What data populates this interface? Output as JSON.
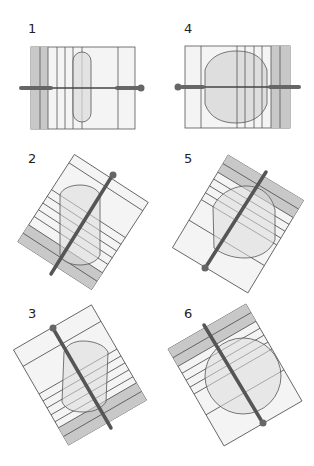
{
  "diagram": {
    "type": "rod-insertion-sequence",
    "colors": {
      "background": "#ffffff",
      "block_fill": "#f2f2f2",
      "stripe_fill": "#f7f7f7",
      "shaded_fill": "#c8c8c8",
      "shape_fill": "#e4e4e4",
      "outline": "#555555",
      "rod": "#555555"
    },
    "panels": [
      {
        "label": "1",
        "orientation": "horizontal",
        "rod_ball": "right",
        "shape": "capsule",
        "shaded_side": "left"
      },
      {
        "label": "2",
        "orientation": "tilted",
        "rod_ball": "top",
        "shape": "capsule",
        "shaded_side": "bottom"
      },
      {
        "label": "3",
        "orientation": "tilted",
        "rod_ball": "top",
        "shape": "capsule",
        "shaded_side": "bottom"
      },
      {
        "label": "4",
        "orientation": "horizontal",
        "rod_ball": "left",
        "shape": "oval",
        "shaded_side": "right"
      },
      {
        "label": "5",
        "orientation": "tilted",
        "rod_ball": "bottom",
        "shape": "oval",
        "shaded_side": "top"
      },
      {
        "label": "6",
        "orientation": "tilted",
        "rod_ball": "bottom",
        "shape": "oval",
        "shaded_side": "top"
      }
    ]
  }
}
